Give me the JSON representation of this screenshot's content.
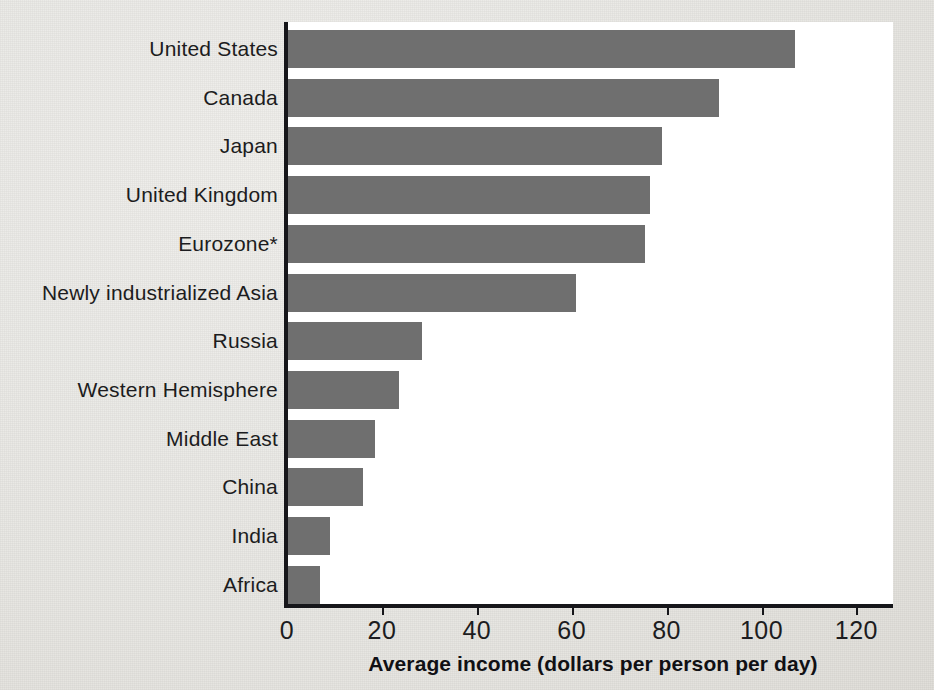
{
  "chart_data": {
    "type": "bar",
    "orientation": "horizontal",
    "title": "",
    "xlabel": "Average income (dollars per person per day)",
    "ylabel": "",
    "xlim": [
      0,
      128
    ],
    "xticks": [
      0,
      20,
      40,
      60,
      80,
      100,
      120
    ],
    "xtick_labels": [
      "0",
      "20",
      "40",
      "60",
      "80",
      "100",
      "120"
    ],
    "grid": false,
    "legend": false,
    "bar_color": "#6f6f6f",
    "axis_color": "#16161a",
    "plot_background": "#ffffff",
    "page_background": "#e8e7e3",
    "categories": [
      "United States",
      "Canada",
      "Japan",
      "United Kingdom",
      "Eurozone*",
      "Newly industrialized Asia",
      "Russia",
      "Western Hemisphere",
      "Middle East",
      "China",
      "India",
      "Africa"
    ],
    "values": [
      107,
      91,
      79,
      76.5,
      75.5,
      61,
      28.5,
      23.5,
      18.5,
      16,
      9,
      7
    ],
    "bars": [
      {
        "label": "United States",
        "value": 107
      },
      {
        "label": "Canada",
        "value": 91
      },
      {
        "label": "Japan",
        "value": 79
      },
      {
        "label": "United Kingdom",
        "value": 76.5
      },
      {
        "label": "Eurozone*",
        "value": 75.5
      },
      {
        "label": "Newly industrialized Asia",
        "value": 61
      },
      {
        "label": "Russia",
        "value": 28.5
      },
      {
        "label": "Western Hemisphere",
        "value": 23.5
      },
      {
        "label": "Middle East",
        "value": 18.5
      },
      {
        "label": "China",
        "value": 16
      },
      {
        "label": "India",
        "value": 9
      },
      {
        "label": "Africa",
        "value": 7
      }
    ]
  }
}
